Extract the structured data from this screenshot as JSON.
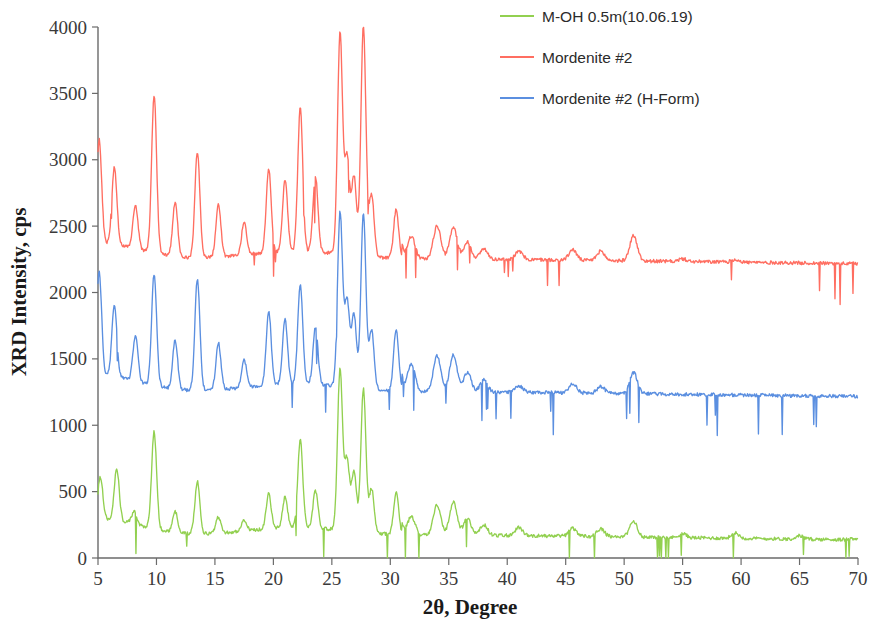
{
  "chart_data": {
    "type": "line",
    "title": "",
    "xlabel": "2θ, Degree",
    "ylabel": "XRD Intensity, cps",
    "xlim": [
      5,
      70
    ],
    "ylim": [
      0,
      4000
    ],
    "xticks": [
      5,
      10,
      15,
      20,
      25,
      30,
      35,
      40,
      45,
      50,
      55,
      60,
      65,
      70
    ],
    "yticks": [
      0,
      500,
      1000,
      1500,
      2000,
      2500,
      3000,
      3500,
      4000
    ],
    "grid": false,
    "legend_position": "top-right",
    "series": [
      {
        "name": "M-OH 0.5m(10.06.19)",
        "color": "#92D050",
        "baseline": 170,
        "peaks": [
          {
            "x": 5.2,
            "y": 490
          },
          {
            "x": 6.6,
            "y": 560
          },
          {
            "x": 8.1,
            "y": 270
          },
          {
            "x": 9.8,
            "y": 900
          },
          {
            "x": 11.6,
            "y": 330
          },
          {
            "x": 13.5,
            "y": 560
          },
          {
            "x": 15.3,
            "y": 290
          },
          {
            "x": 17.5,
            "y": 250
          },
          {
            "x": 19.6,
            "y": 430
          },
          {
            "x": 21.0,
            "y": 400
          },
          {
            "x": 22.3,
            "y": 830
          },
          {
            "x": 23.6,
            "y": 450
          },
          {
            "x": 25.7,
            "y": 1380
          },
          {
            "x": 26.3,
            "y": 700
          },
          {
            "x": 26.9,
            "y": 620
          },
          {
            "x": 27.7,
            "y": 1250
          },
          {
            "x": 28.4,
            "y": 500
          },
          {
            "x": 30.5,
            "y": 480
          },
          {
            "x": 31.8,
            "y": 310
          },
          {
            "x": 34.0,
            "y": 400
          },
          {
            "x": 35.4,
            "y": 420
          },
          {
            "x": 36.6,
            "y": 300
          },
          {
            "x": 38.0,
            "y": 250
          },
          {
            "x": 41.0,
            "y": 230
          },
          {
            "x": 45.6,
            "y": 230
          },
          {
            "x": 48.0,
            "y": 230
          },
          {
            "x": 50.8,
            "y": 290
          },
          {
            "x": 55.0,
            "y": 200
          },
          {
            "x": 59.5,
            "y": 210
          },
          {
            "x": 65.0,
            "y": 195
          },
          {
            "x": 69.5,
            "y": 180
          }
        ]
      },
      {
        "name": "Mordenite #2",
        "color": "#FF6E61",
        "baseline": 2250,
        "peaks": [
          {
            "x": 5.1,
            "y": 3030
          },
          {
            "x": 6.4,
            "y": 2830
          },
          {
            "x": 8.2,
            "y": 2580
          },
          {
            "x": 9.8,
            "y": 3440
          },
          {
            "x": 11.6,
            "y": 2660
          },
          {
            "x": 13.5,
            "y": 3050
          },
          {
            "x": 15.3,
            "y": 2640
          },
          {
            "x": 17.5,
            "y": 2500
          },
          {
            "x": 19.6,
            "y": 2880
          },
          {
            "x": 21.0,
            "y": 2790
          },
          {
            "x": 22.3,
            "y": 3330
          },
          {
            "x": 23.6,
            "y": 2820
          },
          {
            "x": 25.7,
            "y": 3910
          },
          {
            "x": 26.3,
            "y": 2980
          },
          {
            "x": 26.9,
            "y": 2840
          },
          {
            "x": 27.7,
            "y": 3980
          },
          {
            "x": 28.4,
            "y": 2720
          },
          {
            "x": 30.5,
            "y": 2620
          },
          {
            "x": 31.8,
            "y": 2420
          },
          {
            "x": 34.0,
            "y": 2500
          },
          {
            "x": 35.4,
            "y": 2490
          },
          {
            "x": 36.6,
            "y": 2380
          },
          {
            "x": 38.0,
            "y": 2330
          },
          {
            "x": 41.0,
            "y": 2310
          },
          {
            "x": 45.6,
            "y": 2330
          },
          {
            "x": 48.0,
            "y": 2320
          },
          {
            "x": 50.8,
            "y": 2440
          },
          {
            "x": 55.0,
            "y": 2270
          },
          {
            "x": 59.5,
            "y": 2270
          },
          {
            "x": 65.0,
            "y": 2250
          },
          {
            "x": 69.8,
            "y": 2210
          }
        ]
      },
      {
        "name": "Mordenite #2 (H-Form)",
        "color": "#5B8FE0",
        "baseline": 1250,
        "peaks": [
          {
            "x": 5.1,
            "y": 2030
          },
          {
            "x": 6.4,
            "y": 1800
          },
          {
            "x": 8.2,
            "y": 1590
          },
          {
            "x": 9.8,
            "y": 2090
          },
          {
            "x": 11.6,
            "y": 1620
          },
          {
            "x": 13.5,
            "y": 2090
          },
          {
            "x": 15.3,
            "y": 1600
          },
          {
            "x": 17.5,
            "y": 1460
          },
          {
            "x": 19.6,
            "y": 1810
          },
          {
            "x": 21.0,
            "y": 1740
          },
          {
            "x": 22.3,
            "y": 2000
          },
          {
            "x": 23.6,
            "y": 1680
          },
          {
            "x": 25.7,
            "y": 2560
          },
          {
            "x": 26.3,
            "y": 1900
          },
          {
            "x": 26.9,
            "y": 1800
          },
          {
            "x": 27.7,
            "y": 2580
          },
          {
            "x": 28.4,
            "y": 1700
          },
          {
            "x": 30.5,
            "y": 1720
          },
          {
            "x": 31.8,
            "y": 1460
          },
          {
            "x": 34.0,
            "y": 1520
          },
          {
            "x": 35.4,
            "y": 1530
          },
          {
            "x": 36.6,
            "y": 1400
          },
          {
            "x": 38.0,
            "y": 1340
          },
          {
            "x": 41.0,
            "y": 1300
          },
          {
            "x": 45.6,
            "y": 1320
          },
          {
            "x": 48.0,
            "y": 1300
          },
          {
            "x": 50.8,
            "y": 1410
          },
          {
            "x": 55.0,
            "y": 1250
          },
          {
            "x": 59.5,
            "y": 1250
          },
          {
            "x": 65.0,
            "y": 1230
          },
          {
            "x": 69.8,
            "y": 1200
          }
        ]
      }
    ]
  },
  "axes": {
    "y_title": "XRD Intensity, cps",
    "x_title": "2θ, Degree",
    "x_tick_labels": [
      "5",
      "10",
      "15",
      "20",
      "25",
      "30",
      "35",
      "40",
      "45",
      "50",
      "55",
      "60",
      "65",
      "70"
    ],
    "y_tick_labels": [
      "0",
      "500",
      "1000",
      "1500",
      "2000",
      "2500",
      "3000",
      "3500",
      "4000"
    ]
  },
  "legend": {
    "items": [
      {
        "label": "M-OH 0.5m(10.06.19)",
        "color": "#92D050"
      },
      {
        "label": "Mordenite #2",
        "color": "#FF6E61"
      },
      {
        "label": "Mordenite #2 (H-Form)",
        "color": "#5B8FE0"
      }
    ]
  }
}
